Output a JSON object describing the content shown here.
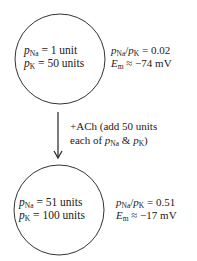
{
  "state_before": {
    "circle_lines": [
      {
        "symbol": "p",
        "sub": "Na",
        "rest": " = 1 unit"
      },
      {
        "symbol": "p",
        "sub": "K",
        "rest": " = 50 units"
      }
    ],
    "ratio": {
      "num_sub": "Na",
      "den_sub": "K",
      "value": " = 0.02"
    },
    "em": {
      "symbol": "E",
      "sub": "m",
      "value": " ≈ −74 mV"
    }
  },
  "transition": {
    "line1": "+ACh (add 50 units",
    "line2_prefix": "each of ",
    "line2_a_sub": "Na",
    "line2_mid": " & ",
    "line2_b_sub": "K",
    "line2_suffix": ")"
  },
  "state_after": {
    "circle_lines": [
      {
        "symbol": "p",
        "sub": "Na",
        "rest": " = 51 units"
      },
      {
        "symbol": "p",
        "sub": "K",
        "rest": " = 100 units"
      }
    ],
    "ratio": {
      "num_sub": "Na",
      "den_sub": "K",
      "value": " = 0.51"
    },
    "em": {
      "symbol": "E",
      "sub": "m",
      "value": " ≈ −17 mV"
    }
  },
  "colors": {
    "stroke": "#333333",
    "text": "#222222"
  }
}
